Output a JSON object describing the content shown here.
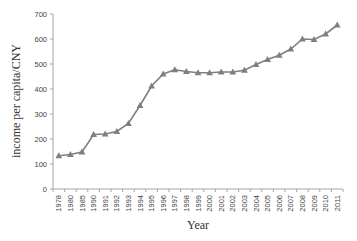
{
  "chart_data": {
    "type": "line",
    "title": "",
    "xlabel": "Year",
    "ylabel": "income per capita/CNY",
    "ylim": [
      0,
      700
    ],
    "yticks": [
      0,
      100,
      200,
      300,
      400,
      500,
      600,
      700
    ],
    "grid": false,
    "legend": null,
    "categories": [
      "1978",
      "1980",
      "1985",
      "1990",
      "1991",
      "1992",
      "1993",
      "1994",
      "1995",
      "1996",
      "1997",
      "1998",
      "1999",
      "2000",
      "2001",
      "2002",
      "2003",
      "2004",
      "2005",
      "2006",
      "2007",
      "2008",
      "2009",
      "2010",
      "2011"
    ],
    "series": [
      {
        "name": "income per capita",
        "marker": "triangle",
        "color": "#7f7f7f",
        "values": [
          133,
          138,
          148,
          218,
          220,
          230,
          262,
          334,
          412,
          460,
          477,
          470,
          465,
          465,
          468,
          468,
          475,
          498,
          518,
          535,
          560,
          600,
          598,
          620,
          656
        ]
      }
    ]
  },
  "colors": {
    "line": "#7f7f7f",
    "marker": "#7f7f7f",
    "axis": "#a6a6a6",
    "text": "#444444"
  }
}
